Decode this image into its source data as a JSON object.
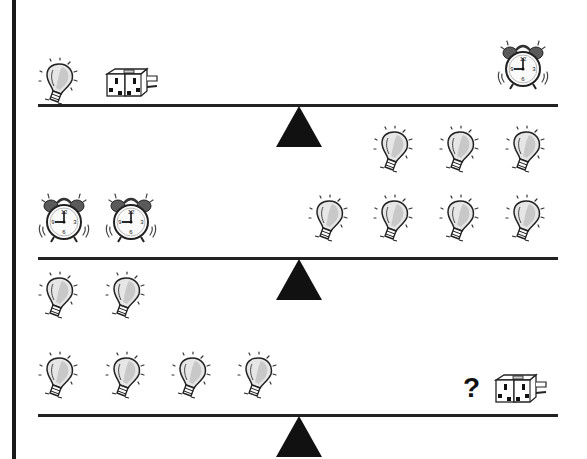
{
  "puzzle": {
    "type": "balance-scale-weight-puzzle",
    "question_mark": "?",
    "scales": [
      {
        "index": 1,
        "left": [
          "lightbulb",
          "plug-adapter"
        ],
        "right": [
          "alarm-clock"
        ]
      },
      {
        "index": 2,
        "left": [
          "alarm-clock",
          "alarm-clock"
        ],
        "right": [
          "lightbulb",
          "lightbulb",
          "lightbulb",
          "lightbulb",
          "lightbulb",
          "lightbulb",
          "lightbulb"
        ]
      },
      {
        "index": 3,
        "left": [
          "lightbulb",
          "lightbulb",
          "lightbulb",
          "lightbulb",
          "lightbulb",
          "lightbulb"
        ],
        "right": [
          "?",
          "plug-adapter"
        ]
      }
    ]
  },
  "colors": {
    "ink": "#111111",
    "bulb_fill": "#d9d9d9",
    "clock_bell": "#555555",
    "background": "#ffffff"
  }
}
